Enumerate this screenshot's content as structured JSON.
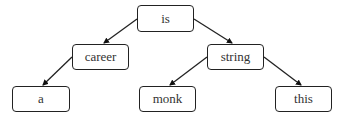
{
  "diagram": {
    "type": "tree",
    "nodes": [
      {
        "id": "is",
        "label": "is",
        "x": 137,
        "y": 5,
        "w": 57,
        "h": 27
      },
      {
        "id": "career",
        "label": "career",
        "x": 72,
        "y": 44,
        "w": 57,
        "h": 26
      },
      {
        "id": "string",
        "label": "string",
        "x": 207,
        "y": 44,
        "w": 57,
        "h": 26
      },
      {
        "id": "a",
        "label": "a",
        "x": 12,
        "y": 86,
        "w": 58,
        "h": 26
      },
      {
        "id": "monk",
        "label": "monk",
        "x": 139,
        "y": 86,
        "w": 57,
        "h": 26
      },
      {
        "id": "this",
        "label": "this",
        "x": 275,
        "y": 86,
        "w": 57,
        "h": 26
      }
    ],
    "edges": [
      {
        "from": "is",
        "to": "career"
      },
      {
        "from": "is",
        "to": "string"
      },
      {
        "from": "career",
        "to": "a"
      },
      {
        "from": "string",
        "to": "monk"
      },
      {
        "from": "string",
        "to": "this"
      }
    ]
  }
}
